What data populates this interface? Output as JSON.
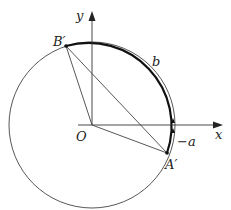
{
  "diagram": {
    "type": "unit-circle-geometry",
    "colors": {
      "stroke": "#333333",
      "bold_arc": "#111111",
      "background": "#ffffff"
    },
    "axes": {
      "x_label": "x",
      "y_label": "y"
    },
    "origin": {
      "label": "O"
    },
    "points": [
      {
        "id": "B-prime",
        "label": "B′"
      },
      {
        "id": "A-prime",
        "label": "A′"
      }
    ],
    "arc_labels": {
      "upper_arc": "b",
      "lower_arc": "−a"
    }
  }
}
